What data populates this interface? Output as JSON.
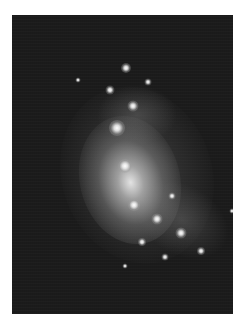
{
  "image": {
    "subject": "spiral galaxy",
    "style": "grayscale astronomical photograph",
    "background_color": "#1b1b1b",
    "border_color": "#ffffff"
  },
  "features": [
    {
      "name": "galaxy-core"
    },
    {
      "name": "bright-knot-upper"
    },
    {
      "name": "star-field"
    }
  ]
}
